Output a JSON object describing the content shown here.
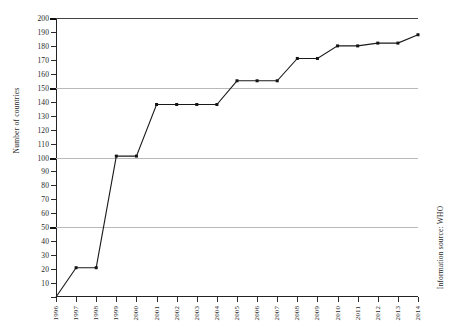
{
  "chart_data": {
    "type": "line",
    "title": "",
    "xlabel": "",
    "ylabel": "Number of countries",
    "categories": [
      "1996",
      "1997",
      "1998",
      "1999",
      "2000",
      "2001",
      "2002",
      "2003",
      "2004",
      "2005",
      "2006",
      "2007",
      "2008",
      "2009",
      "2010",
      "2011",
      "2012",
      "2013",
      "2014"
    ],
    "values": [
      0,
      21,
      21,
      101,
      101,
      138,
      138,
      138,
      138,
      155,
      155,
      155,
      171,
      171,
      180,
      180,
      182,
      182,
      188
    ],
    "series": [
      {
        "name": "Number of countries",
        "values": [
          0,
          21,
          21,
          101,
          101,
          138,
          138,
          138,
          138,
          155,
          155,
          155,
          171,
          171,
          180,
          180,
          182,
          182,
          188
        ]
      }
    ],
    "ylim": [
      0,
      200
    ],
    "ytick_step": 10,
    "yticks": [
      0,
      10,
      20,
      30,
      40,
      50,
      60,
      70,
      80,
      90,
      100,
      110,
      120,
      130,
      140,
      150,
      160,
      170,
      180,
      190,
      200
    ],
    "gridlines": [
      50,
      100,
      150,
      200
    ],
    "grid": true,
    "legend": "none",
    "line_color": "#1a1a1a",
    "marker": "square",
    "annotations": [
      "Information source: WHO"
    ]
  },
  "labels": {
    "y_axis_title": "Number of countries",
    "source_note": "Information source: WHO"
  }
}
